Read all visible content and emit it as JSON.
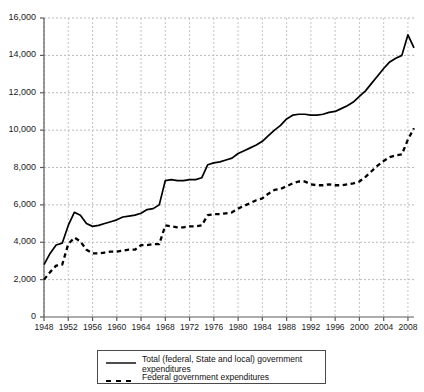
{
  "chart_data": {
    "type": "line",
    "title": "",
    "xlabel": "",
    "ylabel": "",
    "xlim": [
      1948,
      2009
    ],
    "ylim": [
      0,
      16000
    ],
    "ytick_step": 2000,
    "xtick_step": 4,
    "grid": true,
    "legend_position": "bottom-center",
    "ytick_labels": [
      "0",
      "2,000",
      "4,000",
      "6,000",
      "8,000",
      "10,000",
      "12,000",
      "14,000",
      "16,000"
    ],
    "ytick_values": [
      0,
      2000,
      4000,
      6000,
      8000,
      10000,
      12000,
      14000,
      16000
    ],
    "xtick_labels": [
      "1948",
      "1952",
      "1956",
      "1960",
      "1964",
      "1968",
      "1972",
      "1976",
      "1980",
      "1984",
      "1988",
      "1992",
      "1996",
      "2000",
      "2004",
      "2008"
    ],
    "xtick_values": [
      1948,
      1952,
      1956,
      1960,
      1964,
      1968,
      1972,
      1976,
      1980,
      1984,
      1988,
      1992,
      1996,
      2000,
      2004,
      2008
    ],
    "x": [
      1948,
      1949,
      1950,
      1951,
      1952,
      1953,
      1954,
      1955,
      1956,
      1957,
      1958,
      1959,
      1960,
      1961,
      1962,
      1963,
      1964,
      1965,
      1966,
      1967,
      1968,
      1969,
      1970,
      1971,
      1972,
      1973,
      1974,
      1975,
      1976,
      1977,
      1978,
      1979,
      1980,
      1981,
      1982,
      1983,
      1984,
      1985,
      1986,
      1987,
      1988,
      1989,
      1990,
      1991,
      1992,
      1993,
      1994,
      1995,
      1996,
      1997,
      1998,
      1999,
      2000,
      2001,
      2002,
      2003,
      2004,
      2005,
      2006,
      2007,
      2008,
      2009
    ],
    "series": [
      {
        "name": "Total (federal, State and local) government expenditures",
        "style": "solid",
        "color": "#000000",
        "values": [
          2800,
          3400,
          3850,
          3950,
          4900,
          5600,
          5450,
          5000,
          4850,
          4900,
          5000,
          5100,
          5200,
          5350,
          5400,
          5450,
          5550,
          5750,
          5800,
          6000,
          7300,
          7350,
          7300,
          7300,
          7350,
          7350,
          7450,
          8150,
          8250,
          8300,
          8400,
          8500,
          8750,
          8900,
          9050,
          9200,
          9400,
          9700,
          10000,
          10250,
          10600,
          10800,
          10850,
          10850,
          10800,
          10800,
          10850,
          10950,
          11000,
          11150,
          11300,
          11500,
          11800,
          12100,
          12500,
          12900,
          13300,
          13650,
          13850,
          14000,
          15100,
          14400
        ]
      },
      {
        "name": "Federal government expenditures",
        "style": "dashed",
        "color": "#000000",
        "values": [
          2000,
          2400,
          2750,
          2800,
          3900,
          4250,
          4050,
          3600,
          3400,
          3400,
          3450,
          3500,
          3500,
          3550,
          3600,
          3600,
          3850,
          3850,
          3900,
          3900,
          4900,
          4850,
          4800,
          4800,
          4850,
          4850,
          4900,
          5450,
          5500,
          5500,
          5550,
          5600,
          5800,
          5950,
          6100,
          6250,
          6350,
          6600,
          6800,
          6850,
          7000,
          7150,
          7250,
          7250,
          7100,
          7050,
          7050,
          7100,
          7050,
          7050,
          7100,
          7150,
          7250,
          7500,
          7800,
          8100,
          8350,
          8550,
          8650,
          8700,
          9500,
          10100
        ]
      }
    ]
  },
  "legend": {
    "entries": [
      {
        "label": "Total (federal, State and local) government\nexpenditures",
        "style": "solid"
      },
      {
        "label": "Federal government expenditures",
        "style": "dashed"
      }
    ]
  }
}
